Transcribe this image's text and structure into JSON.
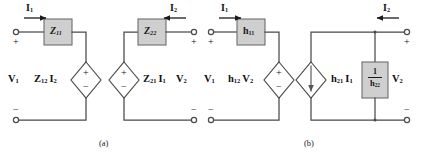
{
  "figure": {
    "background": "#ffffff",
    "wire_color": "#4a4a4a",
    "box_fill": "#cfcfcf",
    "box_stroke": "#6e6e6e",
    "text_color": "#111111"
  },
  "circuit_a": {
    "caption": "(a)",
    "type": "z-parameter (impedance) equivalent circuit",
    "elements": {
      "series_impedance_left": {
        "symbol": "Z",
        "sub": "11",
        "shape": "box"
      },
      "series_impedance_right": {
        "symbol": "Z",
        "sub": "22",
        "shape": "box"
      },
      "dependent_source_left": {
        "coeff": "Z",
        "coeff_sub": "12",
        "var": "I",
        "var_sub": "2",
        "shape": "diamond",
        "kind": "voltage",
        "plus": "+",
        "minus": "−"
      },
      "dependent_source_right": {
        "coeff": "Z",
        "coeff_sub": "21",
        "var": "I",
        "var_sub": "1",
        "shape": "diamond",
        "kind": "voltage",
        "plus": "+",
        "minus": "−"
      }
    },
    "ports": {
      "input_current": {
        "symbol": "I",
        "sub": "1",
        "arrow": "right"
      },
      "output_current": {
        "symbol": "I",
        "sub": "2",
        "arrow": "left"
      },
      "input_voltage": {
        "symbol": "V",
        "sub": "1"
      },
      "output_voltage": {
        "symbol": "V",
        "sub": "2"
      },
      "plus": "+",
      "minus": "−"
    }
  },
  "circuit_b": {
    "caption": "(b)",
    "type": "h-parameter (hybrid) equivalent circuit",
    "elements": {
      "series_impedance_left": {
        "symbol": "h",
        "sub": "11",
        "shape": "box"
      },
      "shunt_impedance_right": {
        "numerator": "1",
        "symbol": "h",
        "sub": "22",
        "shape": "box",
        "fraction": true
      },
      "dependent_source_left": {
        "coeff": "h",
        "coeff_sub": "12",
        "var": "V",
        "var_sub": "2",
        "shape": "diamond",
        "kind": "voltage",
        "plus": "+",
        "minus": "−"
      },
      "dependent_source_right": {
        "coeff": "h",
        "coeff_sub": "21",
        "var": "I",
        "var_sub": "1",
        "shape": "diamond",
        "kind": "current",
        "arrow": "down"
      }
    },
    "ports": {
      "input_current": {
        "symbol": "I",
        "sub": "1",
        "arrow": "right"
      },
      "output_current": {
        "symbol": "I",
        "sub": "2",
        "arrow": "left"
      },
      "input_voltage": {
        "symbol": "V",
        "sub": "1"
      },
      "output_voltage": {
        "symbol": "V",
        "sub": "2"
      },
      "plus": "+",
      "minus": "−"
    }
  }
}
